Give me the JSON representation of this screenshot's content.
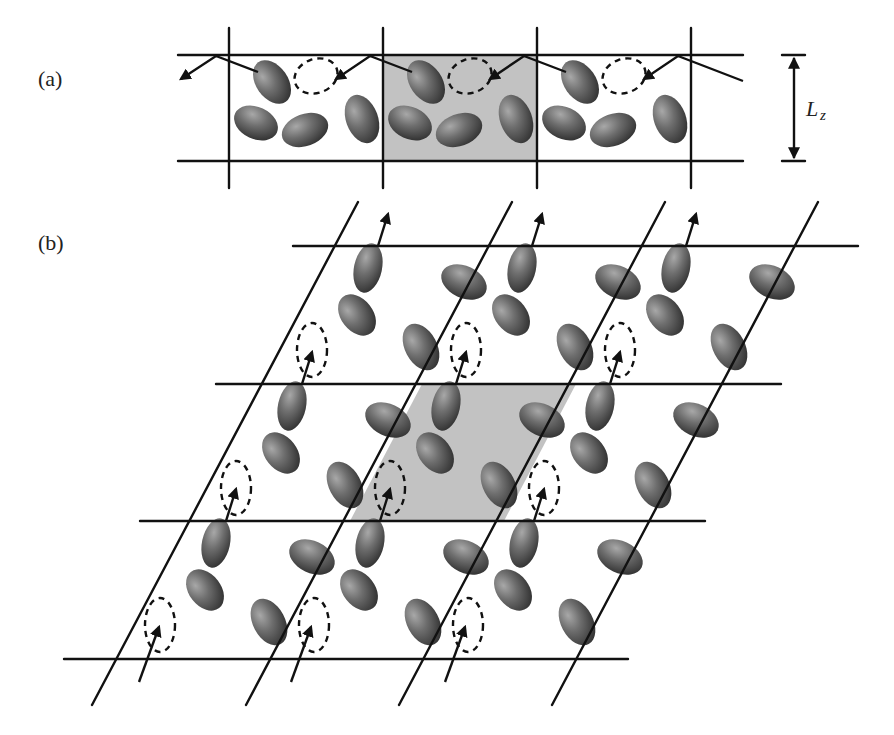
{
  "figure": {
    "panel_a": {
      "label": "(a)",
      "dimension_label": "L",
      "dimension_subscript": "z",
      "description": "Periodic slab with image cells along x; central simulation cell shaded",
      "horizontal_lines_y": [
        55,
        161
      ],
      "vertical_lines_x": [
        229,
        383,
        537,
        691
      ],
      "shaded_cell": {
        "x0": 383,
        "x1": 537
      },
      "cell_width": 154
    },
    "panel_b": {
      "label": "(b)",
      "description": "Sheared (Lees-Edwards type) periodic images; central simulation cell shaded parallelogram",
      "horizontal_lines_y": [
        246,
        384,
        521,
        659
      ],
      "row_shift": [
        -76,
        138
      ],
      "column_shift": 154,
      "shaded_cell": {
        "top_y": 384,
        "bottom_y": 521,
        "top_x0": 422,
        "top_x1": 576,
        "bottom_x0": 350,
        "bottom_x1": 504
      }
    },
    "colors": {
      "background": "#ffffff",
      "line": "#111111",
      "shaded_cell": "#c2c2c2",
      "molecule_light": "#9a9a9a",
      "molecule_dark": "#3a3a3a"
    },
    "icons": {
      "molecule": "ellipsoid-icon",
      "vacancy": "dashed-ellipse-icon",
      "trajectory": "arrow-icon"
    }
  }
}
